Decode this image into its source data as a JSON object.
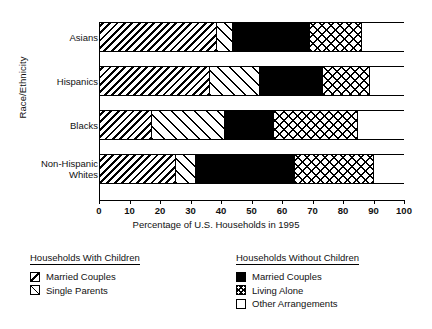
{
  "chart_data": {
    "type": "bar",
    "orientation": "horizontal",
    "stacked": true,
    "title": "",
    "xlabel": "Percentage of U.S. Households in 1995",
    "ylabel": "Race/Ethnicity",
    "xlim": [
      0,
      100
    ],
    "grid": false,
    "legend_position": "bottom",
    "categories": [
      "Asians",
      "Hispanics",
      "Blacks",
      "Non-Hispanic Whites"
    ],
    "xticks": [
      0,
      10,
      20,
      30,
      40,
      50,
      60,
      70,
      80,
      90,
      100
    ],
    "series": [
      {
        "name": "Married Couples",
        "group": "Households With Children",
        "pattern": "diagonal-hatch-dense",
        "values": [
          38.5,
          36.0,
          17.0,
          25.0
        ]
      },
      {
        "name": "Single Parents",
        "group": "Households With Children",
        "pattern": "diagonal-hatch-sparse",
        "values": [
          5.0,
          16.5,
          24.0,
          6.5
        ]
      },
      {
        "name": "Married Couples",
        "group": "Households Without Children",
        "pattern": "solid-black",
        "values": [
          25.5,
          20.5,
          16.0,
          32.5
        ]
      },
      {
        "name": "Living Alone",
        "group": "Households Without Children",
        "pattern": "cross-hatch",
        "values": [
          17.0,
          15.5,
          27.5,
          26.0
        ]
      },
      {
        "name": "Other Arrangements",
        "group": "Households Without Children",
        "pattern": "white",
        "values": [
          14.0,
          11.5,
          15.5,
          10.0
        ]
      }
    ]
  },
  "axes": {
    "y_title": "Race/Ethnicity",
    "x_title": "Percentage of U.S. Households in 1995",
    "category_labels": [
      "Asians",
      "Hispanics",
      "Blacks",
      "Non-Hispanic\nWhites"
    ],
    "x_tick_labels": [
      "0",
      "10",
      "20",
      "30",
      "40",
      "50",
      "60",
      "70",
      "80",
      "90",
      "100"
    ]
  },
  "legends": [
    {
      "title": "Households With Children",
      "items": [
        {
          "label": "Married Couples",
          "swatch": "diagonal-hatch-dense-icon"
        },
        {
          "label": "Single Parents",
          "swatch": "diagonal-hatch-sparse-icon"
        }
      ]
    },
    {
      "title": "Households Without Children",
      "items": [
        {
          "label": "Married Couples",
          "swatch": "solid-black-icon"
        },
        {
          "label": "Living Alone",
          "swatch": "cross-hatch-icon"
        },
        {
          "label": "Other Arrangements",
          "swatch": "white-square-icon"
        }
      ]
    }
  ],
  "colors": {
    "ink": "#000000",
    "background": "#ffffff"
  }
}
